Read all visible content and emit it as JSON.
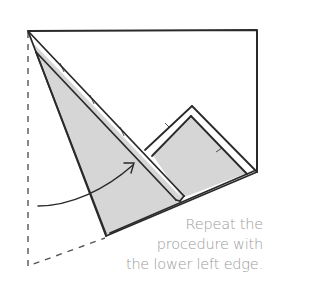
{
  "caption": {
    "lines": [
      "Repeat the",
      "procedure with",
      "the lower left edge."
    ]
  },
  "colors": {
    "stroke": "#2a2a2a",
    "fill": "#d6d6d6",
    "dashed": "#555555",
    "caption": "#9a9a9a",
    "background": "#ffffff"
  }
}
